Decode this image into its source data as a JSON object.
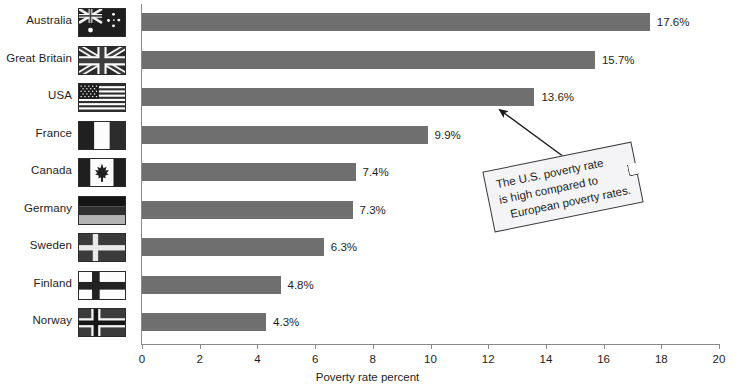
{
  "chart_data": {
    "type": "bar",
    "orientation": "horizontal",
    "title": "",
    "xlabel": "Poverty rate percent",
    "ylabel": "",
    "xlim": [
      0,
      20
    ],
    "xticks": [
      0,
      2,
      4,
      6,
      8,
      10,
      12,
      14,
      16,
      18,
      20
    ],
    "grid": false,
    "legend": "none",
    "bar_color": "#6f6f6f",
    "categories": [
      "Australia",
      "Great Britain",
      "USA",
      "France",
      "Canada",
      "Germany",
      "Sweden",
      "Finland",
      "Norway"
    ],
    "values": [
      17.6,
      15.7,
      13.6,
      9.9,
      7.4,
      7.3,
      6.3,
      4.8,
      4.3
    ],
    "value_labels": [
      "17.6%",
      "15.7%",
      "13.6%",
      "9.9%",
      "7.4%",
      "7.3%",
      "6.3%",
      "4.8%",
      "4.3%"
    ],
    "annotations": [
      {
        "text": "The U.S. poverty rate is high compared to European poverty rates.",
        "lines": [
          "The U.S. poverty rate",
          "is high compared to",
          "European poverty rates."
        ],
        "points_to": "USA"
      }
    ]
  },
  "axis": {
    "x_title": "Poverty rate percent",
    "tick_labels": [
      "0",
      "2",
      "4",
      "6",
      "8",
      "10",
      "12",
      "14",
      "16",
      "18",
      "20"
    ]
  },
  "rows": [
    {
      "label": "Australia",
      "value_label": "17.6%",
      "flag": "flag-australia"
    },
    {
      "label": "Great Britain",
      "value_label": "15.7%",
      "flag": "flag-great-britain"
    },
    {
      "label": "USA",
      "value_label": "13.6%",
      "flag": "flag-usa"
    },
    {
      "label": "France",
      "value_label": "9.9%",
      "flag": "flag-france"
    },
    {
      "label": "Canada",
      "value_label": "7.4%",
      "flag": "flag-canada"
    },
    {
      "label": "Germany",
      "value_label": "7.3%",
      "flag": "flag-germany"
    },
    {
      "label": "Sweden",
      "value_label": "6.3%",
      "flag": "flag-sweden"
    },
    {
      "label": "Finland",
      "value_label": "4.8%",
      "flag": "flag-finland"
    },
    {
      "label": "Norway",
      "value_label": "4.3%",
      "flag": "flag-norway"
    }
  ],
  "callout": {
    "line1": "The U.S. poverty rate",
    "line2": "is high compared to",
    "line3": "European poverty rates."
  }
}
